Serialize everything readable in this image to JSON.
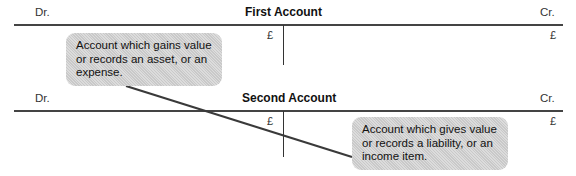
{
  "accounts": [
    {
      "debit_label": "Dr.",
      "title": "First Account",
      "credit_label": "Cr.",
      "debit_currency": "£",
      "credit_currency": "£"
    },
    {
      "debit_label": "Dr.",
      "title": "Second Account",
      "credit_label": "Cr.",
      "debit_currency": "£",
      "credit_currency": "£"
    }
  ],
  "callouts": [
    {
      "text": "Account which gains value or records an asset, or an expense."
    },
    {
      "text": "Account which gives value or records a liability, or an income item."
    }
  ],
  "colors": {
    "line": "#444444",
    "bubble": "#c9c9c9",
    "text": "#1a1a1a"
  }
}
